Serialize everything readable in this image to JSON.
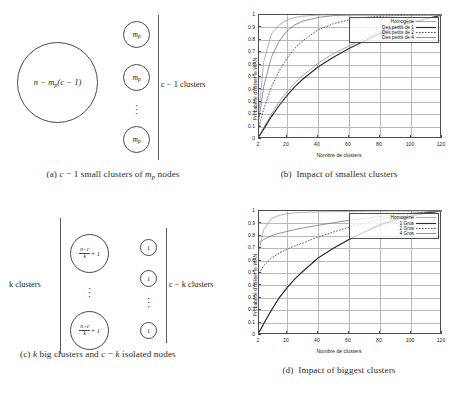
{
  "figure": {
    "panels": [
      {
        "id": "a",
        "caption_prefix": "(a)",
        "caption_text": "c − 1 small clusters of m_p nodes",
        "caption_parts": {
          "lead": "(a)",
          "var1": "c",
          "mid": "− 1 small clusters of",
          "var2": "m",
          "sub2": "p",
          "tail": "nodes"
        }
      },
      {
        "id": "b",
        "caption_prefix": "(b)",
        "caption_text": "(b)  Impact of smallest clusters",
        "caption_body": "Impact of smallest clusters"
      },
      {
        "id": "c",
        "caption_prefix": "(c)",
        "caption_text": "(c) k big clusters and c − k isolated nodes",
        "caption_parts": {
          "lead": "(c)",
          "var1": "k",
          "mid": "big clusters and",
          "var2": "c",
          "op": "−",
          "var3": "k",
          "tail": "isolated",
          "tail2": "nodes"
        }
      },
      {
        "id": "d",
        "caption_prefix": "(d)",
        "caption_text": "(d)  Impact of biggest clusters",
        "caption_body": "Impact of biggest clusters"
      }
    ]
  },
  "diagram_a": {
    "big_circle_label": "n − m_p(c − 1)",
    "big_circle_parts": {
      "n": "n",
      "minus": "−",
      "m": "m",
      "sub": "p",
      "paren": "(c − 1)"
    },
    "small_circle_label": "m",
    "small_circle_sub": "p",
    "small_circle_count_shown": 3,
    "vertical_dots": "⋮",
    "bracket_label": "c − 1 clusters"
  },
  "diagram_c": {
    "big_circle_numerator": "n−c",
    "big_circle_denominator": "k",
    "big_circle_suffix": "+ 1",
    "big_circle_label": "(n−c)/k + 1",
    "big_circle_count_shown": 2,
    "small_circle_label": "1",
    "small_circle_count_shown": 3,
    "vertical_dots": "⋮",
    "left_bracket_label": "k clusters",
    "right_bracket_label": "c − k clusters"
  },
  "chart_data": [
    {
      "panel": "b",
      "type": "line",
      "title": "",
      "xlabel": "Nombre de clusters",
      "ylabel": "Probabilité d'utiliser le WAN",
      "xlim": [
        2,
        120
      ],
      "ylim": [
        0,
        1
      ],
      "xticks": [
        2,
        20,
        40,
        60,
        80,
        100,
        120
      ],
      "yticks": [
        0,
        0.1,
        0.2,
        0.3,
        0.4,
        0.5,
        0.6,
        0.7,
        0.8,
        0.9,
        1
      ],
      "grid": true,
      "legend_position": "top-right",
      "x": [
        2,
        5,
        10,
        15,
        20,
        25,
        30,
        40,
        50,
        60,
        70,
        80,
        90,
        100,
        110,
        120
      ],
      "series": [
        {
          "name": "Homogène",
          "style": "solid-thin",
          "color": "#8a8a8a",
          "values": [
            0.02,
            0.09,
            0.2,
            0.3,
            0.38,
            0.45,
            0.51,
            0.61,
            0.69,
            0.75,
            0.81,
            0.86,
            0.9,
            0.94,
            0.97,
            1.0
          ]
        },
        {
          "name": "Des petits de 1",
          "style": "solid-thick",
          "color": "#2b2b2b",
          "values": [
            0.02,
            0.08,
            0.18,
            0.27,
            0.35,
            0.42,
            0.48,
            0.58,
            0.66,
            0.73,
            0.79,
            0.85,
            0.9,
            0.94,
            0.97,
            1.0
          ]
        },
        {
          "name": "Des petits de 2",
          "style": "dotted",
          "color": "#3a3a3a",
          "values": [
            0.1,
            0.24,
            0.42,
            0.55,
            0.65,
            0.73,
            0.79,
            0.88,
            0.93,
            0.96,
            0.98,
            0.99,
            0.995,
            1.0,
            1.0,
            1.0
          ]
        },
        {
          "name": "Des petits de 4",
          "style": "solid-thin",
          "color": "#6e6e6e",
          "values": [
            0.16,
            0.42,
            0.66,
            0.79,
            0.87,
            0.92,
            0.95,
            0.98,
            0.995,
            1.0,
            1.0,
            1.0,
            1.0,
            1.0,
            1.0,
            1.0
          ]
        },
        {
          "name": "Des petits de 4 (upper)",
          "style": "solid-thin",
          "color": "#9a9a9a",
          "values": [
            0.22,
            0.62,
            0.85,
            0.92,
            0.96,
            0.98,
            0.99,
            1.0,
            1.0,
            1.0,
            1.0,
            1.0,
            1.0,
            1.0,
            1.0,
            1.0
          ]
        }
      ]
    },
    {
      "panel": "d",
      "type": "line",
      "title": "",
      "xlabel": "Nombre de clusters",
      "ylabel": "Probabilité d'utiliser le WAN",
      "xlim": [
        2,
        120
      ],
      "ylim": [
        0,
        1
      ],
      "xticks": [
        2,
        20,
        40,
        60,
        80,
        100,
        120
      ],
      "yticks": [
        0,
        0.1,
        0.2,
        0.3,
        0.4,
        0.5,
        0.6,
        0.7,
        0.8,
        0.9,
        1
      ],
      "grid": true,
      "legend_position": "top-right",
      "x": [
        2,
        5,
        10,
        15,
        20,
        25,
        30,
        40,
        50,
        60,
        70,
        80,
        90,
        100,
        110,
        120
      ],
      "series": [
        {
          "name": "Homogène",
          "style": "solid-thin",
          "color": "#8a8a8a",
          "values": [
            0.02,
            0.09,
            0.2,
            0.3,
            0.38,
            0.45,
            0.51,
            0.62,
            0.7,
            0.77,
            0.83,
            0.88,
            0.93,
            0.96,
            0.985,
            1.0
          ]
        },
        {
          "name": "1 Gros",
          "style": "solid-thick",
          "color": "#2b2b2b",
          "values": [
            0.02,
            0.09,
            0.2,
            0.3,
            0.38,
            0.45,
            0.51,
            0.62,
            0.7,
            0.77,
            0.83,
            0.89,
            0.93,
            0.96,
            0.985,
            1.0
          ]
        },
        {
          "name": "2 Gros",
          "style": "dotted",
          "color": "#3a3a3a",
          "values": [
            0.5,
            0.56,
            0.62,
            0.66,
            0.69,
            0.72,
            0.74,
            0.79,
            0.83,
            0.87,
            0.9,
            0.93,
            0.955,
            0.975,
            0.99,
            1.0
          ]
        },
        {
          "name": "4 Gros",
          "style": "solid-thin",
          "color": "#6e6e6e",
          "values": [
            0.74,
            0.77,
            0.8,
            0.82,
            0.835,
            0.85,
            0.862,
            0.885,
            0.905,
            0.925,
            0.94,
            0.955,
            0.97,
            0.982,
            0.992,
            1.0
          ]
        },
        {
          "name": "4 Gros (upper)",
          "style": "solid-thin",
          "color": "#9a9a9a",
          "values": [
            0.68,
            0.85,
            0.94,
            0.965,
            0.978,
            0.985,
            0.989,
            0.993,
            0.995,
            0.996,
            0.997,
            0.998,
            0.999,
            0.999,
            1.0,
            1.0
          ]
        }
      ]
    }
  ]
}
